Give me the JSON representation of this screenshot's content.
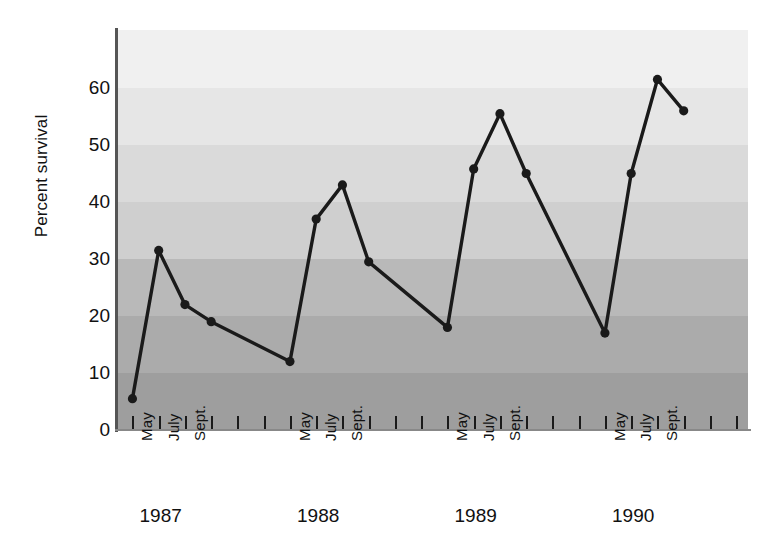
{
  "chart_data": {
    "type": "line",
    "title": "",
    "xlabel": "",
    "ylabel": "Percent survival",
    "ylim": [
      0,
      68
    ],
    "yticks": [
      0,
      10,
      20,
      30,
      40,
      50,
      60
    ],
    "ytick_labels": [
      "0",
      "10",
      "20",
      "30",
      "40",
      "50",
      "60"
    ],
    "grid": false,
    "legend": "none",
    "background_bands": {
      "description": "horizontal grey bands every 10 percent units, darker toward the bottom",
      "colors": [
        "#f0f0f0",
        "#e6e6e6",
        "#dadada",
        "#cfcfcf",
        "#b9b9b9",
        "#ababab",
        "#9e9e9e",
        "#949494"
      ]
    },
    "line_color": "#1a1a1a",
    "marker": "circle",
    "year_groups": [
      {
        "year": "1987",
        "month_labels": [
          "May",
          "July",
          "Sept."
        ],
        "points": [
          {
            "label": "May",
            "value": 5.5
          },
          {
            "label": "",
            "value": 31.5
          },
          {
            "label": "July",
            "value": 22.0
          },
          {
            "label": "Sept.",
            "value": 19.0
          }
        ]
      },
      {
        "year": "1988",
        "month_labels": [
          "May",
          "July",
          "Sept."
        ],
        "points": [
          {
            "label": "May",
            "value": 12.0
          },
          {
            "label": "",
            "value": 37.0
          },
          {
            "label": "July",
            "value": 43.0
          },
          {
            "label": "Sept.",
            "value": 29.5
          }
        ]
      },
      {
        "year": "1989",
        "month_labels": [
          "May",
          "July",
          "Sept."
        ],
        "points": [
          {
            "label": "May",
            "value": 18.0
          },
          {
            "label": "",
            "value": 45.8
          },
          {
            "label": "July",
            "value": 55.5
          },
          {
            "label": "Sept.",
            "value": 45.0
          }
        ]
      },
      {
        "year": "1990",
        "month_labels": [
          "May",
          "July",
          "Sept."
        ],
        "points": [
          {
            "label": "May",
            "value": 17.0
          },
          {
            "label": "",
            "value": 45.0
          },
          {
            "label": "July",
            "value": 61.5
          },
          {
            "label": "Sept.",
            "value": 56.0
          }
        ]
      }
    ],
    "x": [
      0,
      1,
      2,
      3,
      6,
      7,
      8,
      9,
      12,
      13,
      14,
      15,
      18,
      19,
      20,
      21
    ],
    "values": [
      5.5,
      31.5,
      22.0,
      19.0,
      12.0,
      37.0,
      43.0,
      29.5,
      18.0,
      45.8,
      55.5,
      45.0,
      17.0,
      45.0,
      61.5,
      56.0
    ]
  }
}
